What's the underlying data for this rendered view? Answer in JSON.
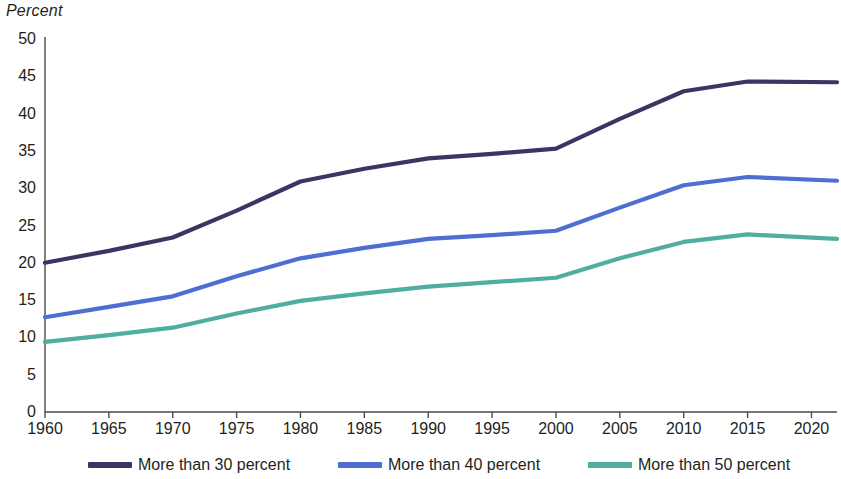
{
  "chart_data": {
    "type": "line",
    "title": "",
    "subtitle": "",
    "xlabel": "",
    "ylabel": "Percent",
    "ylabel_style": "italic",
    "xlim": [
      1960,
      2022
    ],
    "ylim": [
      0,
      50
    ],
    "y_ticks": [
      0,
      5,
      10,
      15,
      20,
      25,
      30,
      35,
      40,
      45,
      50
    ],
    "y_tick_labels": [
      "0",
      "5",
      "10",
      "15",
      "20",
      "25",
      "30",
      "35",
      "40",
      "45",
      "50"
    ],
    "x_ticks": [
      1960,
      1965,
      1970,
      1975,
      1980,
      1985,
      1990,
      1995,
      2000,
      2005,
      2010,
      2015,
      2020
    ],
    "x_tick_labels": [
      "1960",
      "1965",
      "1970",
      "1975",
      "1980",
      "1985",
      "1990",
      "1995",
      "2000",
      "2005",
      "2010",
      "2015",
      "2020"
    ],
    "grid": false,
    "legend_position": "bottom",
    "x": [
      1960,
      1965,
      1970,
      1975,
      1980,
      1985,
      1990,
      1995,
      2000,
      2005,
      2010,
      2015,
      2022
    ],
    "series": [
      {
        "name": "More than 30 percent",
        "color": "#3b3563",
        "values": [
          20.0,
          21.6,
          23.4,
          27.0,
          30.9,
          32.6,
          34.0,
          34.6,
          35.3,
          39.3,
          43.0,
          44.3,
          44.2
        ]
      },
      {
        "name": "More than 40 percent",
        "color": "#4e6ed2",
        "values": [
          12.7,
          14.1,
          15.5,
          18.2,
          20.6,
          22.0,
          23.2,
          23.7,
          24.3,
          27.4,
          30.4,
          31.5,
          31.0
        ]
      },
      {
        "name": "More than 50 percent",
        "color": "#4fae9f",
        "values": [
          9.4,
          10.3,
          11.3,
          13.2,
          14.9,
          15.9,
          16.8,
          17.4,
          18.0,
          20.6,
          22.8,
          23.8,
          23.2
        ]
      }
    ]
  },
  "axis": {
    "y_title": "Percent"
  },
  "legend": {
    "items": [
      {
        "label": "More than 30 percent",
        "color": "#3b3563"
      },
      {
        "label": "More than 40 percent",
        "color": "#4e6ed2"
      },
      {
        "label": "More than 50 percent",
        "color": "#4fae9f"
      }
    ]
  },
  "colors": {
    "axis": "#4a4a4a",
    "text": "#231f20",
    "background": "#ffffff"
  }
}
